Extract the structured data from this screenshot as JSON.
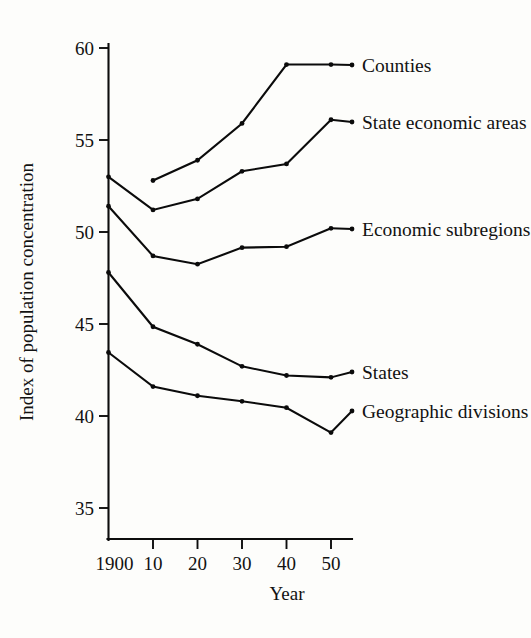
{
  "figure": {
    "background_color": "#fdfdfb",
    "ink_color": "#0b0b0b"
  },
  "chart_data": {
    "type": "line",
    "title": "",
    "xlabel": "Year",
    "ylabel": "Index of population concentration",
    "x": [
      1900,
      1910,
      1920,
      1930,
      1940,
      1950
    ],
    "xtick_labels": [
      "1900",
      "10",
      "20",
      "30",
      "40",
      "50"
    ],
    "ytick_labels": [
      "35",
      "40",
      "45",
      "50",
      "55",
      "60"
    ],
    "yticks": [
      35,
      40,
      45,
      50,
      55,
      60
    ],
    "xlim": [
      1900,
      1950
    ],
    "ylim": [
      35,
      60
    ],
    "grid": false,
    "legend_position": "right-inline-labels",
    "series": [
      {
        "name": "Counties",
        "label": "Counties",
        "x": [
          1910,
          1920,
          1930,
          1940,
          1950
        ],
        "values": [
          52.8,
          53.9,
          55.9,
          59.1,
          59.1
        ],
        "label_x": 1950,
        "label_y": 59.1
      },
      {
        "name": "State economic areas",
        "label": "State economic areas",
        "x": [
          1900,
          1910,
          1920,
          1930,
          1940,
          1950
        ],
        "values": [
          53.0,
          51.2,
          51.8,
          53.3,
          53.7,
          56.1
        ],
        "label_x": 1950,
        "label_y": 56.1
      },
      {
        "name": "Economic subregions",
        "label": "Economic subregions",
        "x": [
          1900,
          1910,
          1920,
          1930,
          1940,
          1950
        ],
        "values": [
          51.4,
          48.7,
          48.25,
          49.15,
          49.2,
          50.2
        ],
        "label_x": 1950,
        "label_y": 50.2
      },
      {
        "name": "States",
        "label": "States",
        "x": [
          1900,
          1910,
          1920,
          1930,
          1940,
          1950
        ],
        "values": [
          47.8,
          44.85,
          43.9,
          42.7,
          42.2,
          42.1
        ],
        "label_x": 1950,
        "label_y": 42.1
      },
      {
        "name": "Geographic divisions",
        "label": "Geographic divisions",
        "x": [
          1900,
          1910,
          1920,
          1930,
          1940,
          1950
        ],
        "values": [
          43.45,
          41.6,
          41.1,
          40.8,
          40.45,
          39.1
        ],
        "label_x": 1950,
        "label_y": 39.1
      }
    ]
  }
}
